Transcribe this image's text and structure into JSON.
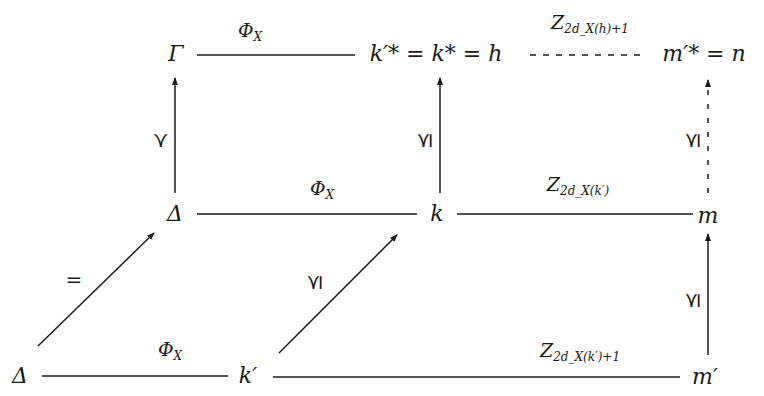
{
  "diagram": {
    "type": "commutative-diagram",
    "colors": {
      "ink": "#1a1a1a",
      "background": "#ffffff"
    },
    "nodes": {
      "gamma": "Γ",
      "top_middle": "k′* = k* = h",
      "top_right": "m′* = n",
      "delta_mid": "Δ",
      "k": "k",
      "m": "m",
      "delta_bottom": "Δ",
      "k_prime": "k′",
      "m_prime": "m′"
    },
    "edge_labels": {
      "top_left": {
        "base": "Φ",
        "sub": "X"
      },
      "top_right": {
        "base": "Z",
        "sub": "2d_X(h)+1"
      },
      "mid_left": {
        "base": "Φ",
        "sub": "X"
      },
      "mid_right": {
        "base": "Z",
        "sub": "2d_X(k′)"
      },
      "bottom_left": {
        "base": "Φ",
        "sub": "X"
      },
      "bottom_right": {
        "base": "Z",
        "sub": "2d_X(k′)+1"
      },
      "vertical_left": "≺",
      "vertical_middle": "⪯",
      "vertical_right_upper": "⪯",
      "vertical_right_lower": "⪯",
      "diagonal_left": "=",
      "diagonal_right": "⪯"
    },
    "edges": [
      {
        "from": "gamma",
        "to": "top_middle",
        "style": "solid",
        "arrow": false
      },
      {
        "from": "top_middle",
        "to": "top_right",
        "style": "dashed",
        "arrow": false
      },
      {
        "from": "delta_mid",
        "to": "k",
        "style": "solid",
        "arrow": false
      },
      {
        "from": "k",
        "to": "m",
        "style": "solid",
        "arrow": false
      },
      {
        "from": "delta_bottom",
        "to": "k_prime",
        "style": "solid",
        "arrow": false
      },
      {
        "from": "k_prime",
        "to": "m_prime",
        "style": "solid",
        "arrow": false
      },
      {
        "from": "delta_mid",
        "to": "gamma",
        "style": "solid",
        "arrow": true
      },
      {
        "from": "k",
        "to": "top_middle",
        "style": "solid",
        "arrow": true
      },
      {
        "from": "m",
        "to": "top_right",
        "style": "dashed",
        "arrow": true
      },
      {
        "from": "m_prime",
        "to": "m",
        "style": "solid",
        "arrow": true
      },
      {
        "from": "delta_bottom",
        "to": "delta_mid",
        "style": "solid",
        "arrow": true
      },
      {
        "from": "k_prime",
        "to": "k",
        "style": "solid",
        "arrow": true
      }
    ]
  }
}
